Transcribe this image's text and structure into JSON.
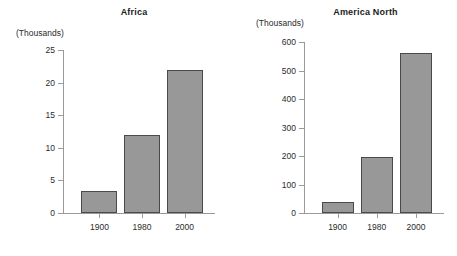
{
  "figure": {
    "background": "#ffffff",
    "bar_fill": "#989898",
    "bar_stroke": "#4a4a4a",
    "axis_color": "#9a9a9a",
    "units_label": "(Thousands)"
  },
  "chart_data": [
    {
      "type": "bar",
      "title": "Africa",
      "xlabel": "",
      "ylabel": "(Thousands)",
      "categories": [
        "1900",
        "1980",
        "2000"
      ],
      "values": [
        3.3,
        12,
        22
      ],
      "yticks": [
        0,
        5,
        10,
        15,
        20,
        25
      ],
      "ytick_labels": [
        "0",
        "5",
        "10",
        "15",
        "20",
        "25"
      ],
      "ylim": [
        0,
        25
      ],
      "grid": false,
      "legend": false
    },
    {
      "type": "bar",
      "title": "America North",
      "xlabel": "",
      "ylabel": "(Thousands)",
      "categories": [
        "1900",
        "1980",
        "2000"
      ],
      "values": [
        40,
        198,
        560
      ],
      "yticks": [
        0,
        100,
        200,
        300,
        400,
        500,
        600
      ],
      "ytick_labels": [
        "0",
        "100",
        "200",
        "300",
        "400",
        "500",
        "600"
      ],
      "ylim": [
        0,
        600
      ],
      "grid": false,
      "legend": false
    }
  ]
}
